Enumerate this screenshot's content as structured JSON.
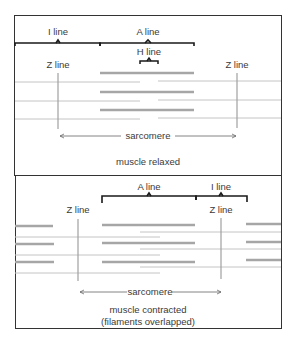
{
  "relaxed_panel": {
    "labels": {
      "i_line": "I line",
      "a_line": "A line",
      "h_line": "H line",
      "z_line_left": "Z line",
      "z_line_right": "Z line",
      "sarcomere": "sarcomere"
    },
    "caption": "muscle relaxed"
  },
  "contracted_panel": {
    "labels": {
      "a_line": "A line",
      "i_line": "I line",
      "z_line_left": "Z line",
      "z_line_right": "Z line",
      "sarcomere": "sarcomere"
    },
    "caption_line1": "muscle contracted",
    "caption_line2": "(filaments overlapped)"
  },
  "colors": {
    "border": "#333333",
    "bracket": "#1a1a1a",
    "thick_filament": "#a6a6a6",
    "thin_filament": "#c4c4c4",
    "z_line": "#a0a0a0",
    "text": "#3a3a3a"
  }
}
